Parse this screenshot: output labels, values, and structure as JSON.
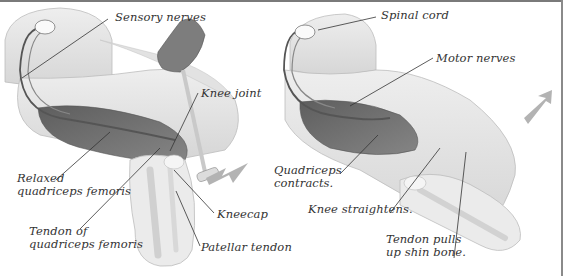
{
  "panels": [
    {
      "id": "left",
      "description": "Leg bent with hammer tapping knee",
      "labels": {
        "sensory_nerves": "Sensory nerves",
        "knee_joint": "Knee joint",
        "relaxed_quad_1": "Relaxed",
        "relaxed_quad_2": "quadriceps femoris",
        "tendon_quad_1": "Tendon of",
        "tendon_quad_2": "quadriceps femoris",
        "kneecap": "Kneecap",
        "patellar_tendon": "Patellar tendon"
      }
    },
    {
      "id": "right",
      "description": "Leg straightening after reflex",
      "labels": {
        "spinal_cord": "Spinal cord",
        "motor_nerves": "Motor nerves",
        "quad_contracts_1": "Quadriceps",
        "quad_contracts_2": "contracts.",
        "knee_straightens": "Knee straightens.",
        "tendon_pulls_1": "Tendon pulls",
        "tendon_pulls_2": "up shin bone."
      }
    }
  ],
  "colors": {
    "leg": "#e6e6e6",
    "leg_shade": "#cfcfcf",
    "muscle": "#6e6e6e",
    "arrow": "#b0b0b0",
    "leader": "#333333",
    "frame": "#7a7a7a"
  }
}
